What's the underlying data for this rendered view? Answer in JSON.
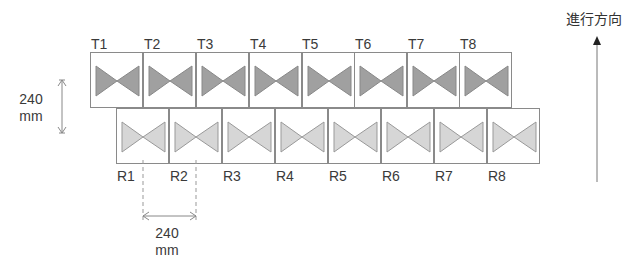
{
  "direction": {
    "label": "進行方向"
  },
  "top_row": {
    "labels": [
      "T1",
      "T2",
      "T3",
      "T4",
      "T5",
      "T6",
      "T7",
      "T8"
    ],
    "fill": "#a0a0a0"
  },
  "bottom_row": {
    "labels": [
      "R1",
      "R2",
      "R3",
      "R4",
      "R5",
      "R6",
      "R7",
      "R8"
    ],
    "fill": "#d6d6d6"
  },
  "dimensions": {
    "vertical": {
      "value": "240",
      "unit": "mm"
    },
    "horizontal": {
      "value": "240",
      "unit": "mm"
    }
  }
}
